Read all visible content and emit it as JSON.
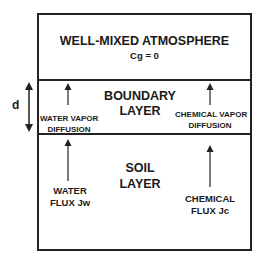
{
  "diagram": {
    "atmosphere": {
      "title": "WELL-MIXED ATMOSPHERE",
      "condition": "Cg = 0"
    },
    "boundary_layer": {
      "line1": "BOUNDARY",
      "line2": "LAYER",
      "thickness_label": "d",
      "left_arrow": {
        "line1": "WATER VAPOR",
        "line2": "DIFFUSION"
      },
      "right_arrow": {
        "line1": "CHEMICAL VAPOR",
        "line2": "DIFFUSION"
      }
    },
    "soil_layer": {
      "line1": "SOIL",
      "line2": "LAYER",
      "left_arrow": {
        "line1": "WATER",
        "line2": "FLUX Jw"
      },
      "right_arrow": {
        "line1": "CHEMICAL",
        "line2": "FLUX Jc"
      }
    }
  }
}
